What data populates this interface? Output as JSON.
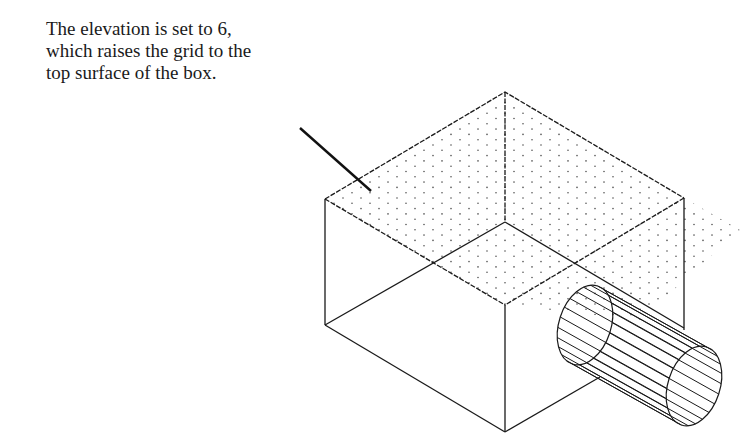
{
  "caption": {
    "lines": [
      "The elevation is set to 6,",
      "which raises the grid to the",
      "top surface of the box."
    ]
  },
  "figure": {
    "elevation": 6,
    "colors": {
      "line": "#1a1a1a",
      "grid_dot": "#555555",
      "background": "#ffffff"
    }
  }
}
